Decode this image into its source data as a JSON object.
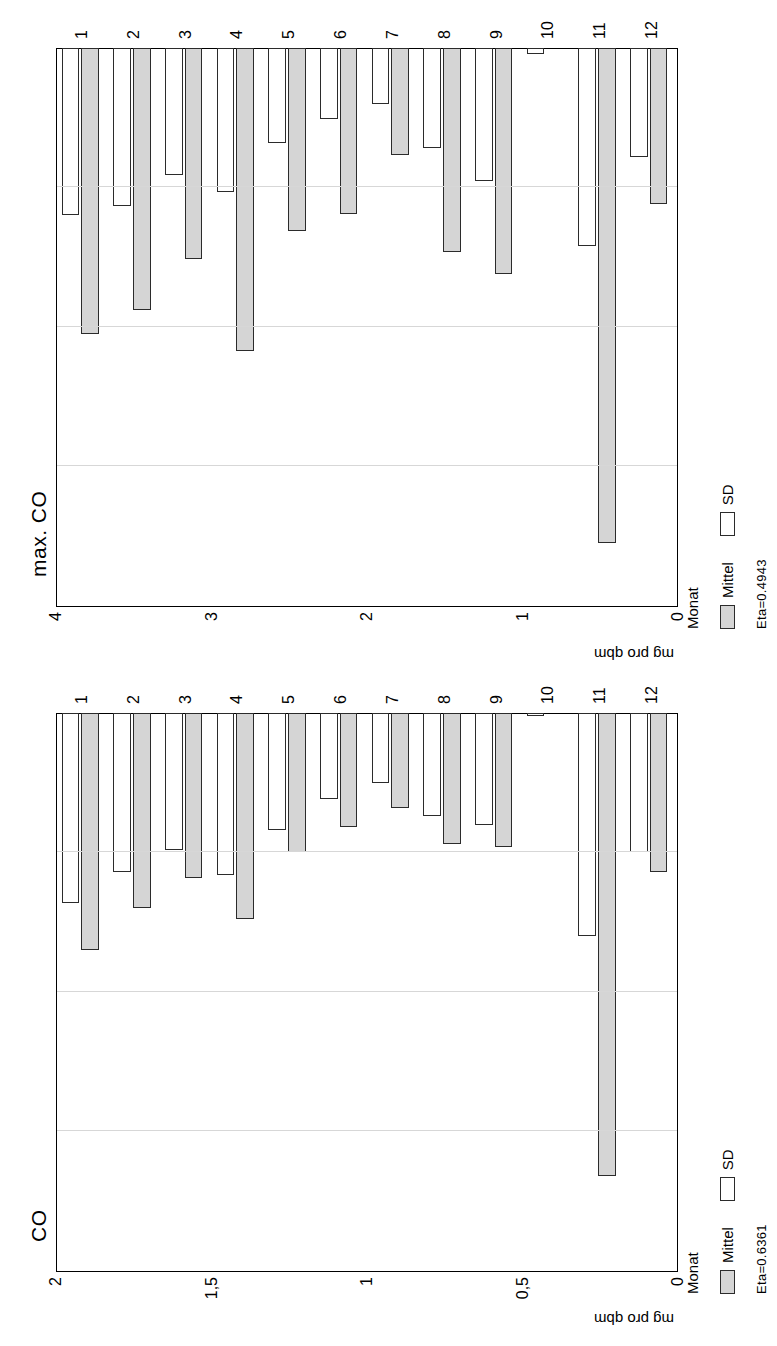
{
  "chart_data": [
    {
      "type": "bar",
      "title": "CO",
      "xlabel": "Monat",
      "ylabel": "mg pro qbm",
      "categories": [
        "1",
        "2",
        "3",
        "4",
        "5",
        "6",
        "7",
        "8",
        "9",
        "10",
        "11",
        "12"
      ],
      "ytick_labels": [
        "0",
        "0,5",
        "1",
        "1,5",
        "2"
      ],
      "ylim": [
        0,
        2
      ],
      "grid": true,
      "legend_position": "below-axis",
      "series": [
        {
          "name": "Mittel",
          "values": [
            0.85,
            0.7,
            0.59,
            0.74,
            0.5,
            0.41,
            0.34,
            0.47,
            0.48,
            0.0,
            1.66,
            0.57
          ]
        },
        {
          "name": "SD",
          "values": [
            0.68,
            0.57,
            0.49,
            0.58,
            0.42,
            0.31,
            0.25,
            0.37,
            0.4,
            0.01,
            0.8,
            0.5
          ]
        }
      ],
      "annotation": "Eta=0.6361"
    },
    {
      "type": "bar",
      "title": "max. CO",
      "xlabel": "Monat",
      "ylabel": "mg pro qbm",
      "categories": [
        "1",
        "2",
        "3",
        "4",
        "5",
        "6",
        "7",
        "8",
        "9",
        "10",
        "11",
        "12"
      ],
      "ytick_labels": [
        "0",
        "1",
        "2",
        "3",
        "4"
      ],
      "ylim": [
        0,
        4
      ],
      "grid": true,
      "legend_position": "below-axis",
      "series": [
        {
          "name": "Mittel",
          "values": [
            2.05,
            1.88,
            1.51,
            2.17,
            1.31,
            1.19,
            0.77,
            1.46,
            1.62,
            0.0,
            3.55,
            1.12
          ]
        },
        {
          "name": "SD",
          "values": [
            1.2,
            1.13,
            0.91,
            1.03,
            0.68,
            0.51,
            0.4,
            0.72,
            0.95,
            0.04,
            1.42,
            0.78
          ]
        }
      ],
      "annotation": "Eta=0.4943"
    }
  ],
  "legend": {
    "mittel_label": "Mittel",
    "sd_label": "SD"
  },
  "colors": {
    "mittel_fill": "#d5d5d5",
    "sd_fill": "#ffffff",
    "bar_stroke": "#2b2b2b",
    "axis": "#000000",
    "grid": "#d7d7d7"
  }
}
